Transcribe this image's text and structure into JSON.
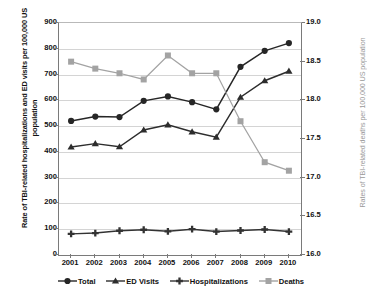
{
  "chart_data": {
    "type": "line",
    "title": "",
    "xlabel": "",
    "ylabel": "Rate of TBI-related hospitalizations and ED visits per 100,000 US population",
    "y2label": "Rates of TBI-related deaths per 100,000 US population",
    "categories": [
      "2001",
      "2002",
      "2003",
      "2004",
      "2005",
      "2006",
      "2007",
      "2008",
      "2009",
      "2010"
    ],
    "ylim": [
      0,
      900
    ],
    "yticks": [
      "0",
      "100",
      "200",
      "300",
      "400",
      "500",
      "600",
      "700",
      "800",
      "900"
    ],
    "y2lim": [
      16.0,
      19.0
    ],
    "y2ticks": [
      "16.0",
      "16.5",
      "17.0",
      "17.5",
      "18.0",
      "18.5",
      "19.0"
    ],
    "grid": true,
    "legend_position": "bottom",
    "series": [
      {
        "name": "Total",
        "axis": "left",
        "marker": "circle",
        "color": "#262626",
        "values": [
          520,
          537,
          535,
          598,
          615,
          593,
          565,
          730,
          792,
          822
        ]
      },
      {
        "name": "ED Visits",
        "axis": "left",
        "marker": "triangle",
        "color": "#2d2d2d",
        "values": [
          419,
          432,
          420,
          485,
          505,
          478,
          457,
          612,
          676,
          713
        ]
      },
      {
        "name": "Hospitalizations",
        "axis": "left",
        "marker": "cross",
        "color": "#333333",
        "values": [
          82,
          85,
          94,
          98,
          92,
          100,
          91,
          95,
          99,
          91
        ]
      },
      {
        "name": "Deaths",
        "axis": "right",
        "marker": "square",
        "color": "#a3a3a3",
        "values": [
          18.5,
          18.41,
          18.35,
          18.27,
          18.58,
          18.35,
          18.35,
          17.73,
          17.2,
          17.09
        ]
      }
    ]
  },
  "legend": {
    "items": [
      {
        "label": "Total"
      },
      {
        "label": "ED Visits"
      },
      {
        "label": "Hospitalizations"
      },
      {
        "label": "Deaths"
      }
    ]
  }
}
